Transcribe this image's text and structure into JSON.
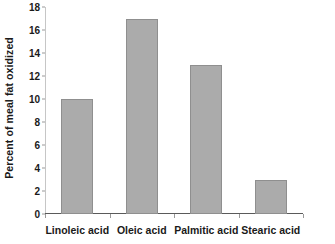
{
  "chart_data": {
    "type": "bar",
    "title": "",
    "xlabel": "",
    "ylabel": "Percent of meal fat oxidized",
    "categories": [
      "Linoleic acid",
      "Oleic acid",
      "Palmitic acid",
      "Stearic acid"
    ],
    "values": [
      10,
      17,
      13,
      3
    ],
    "series": [
      {
        "name": "Percent of meal fat oxidized",
        "values": [
          10,
          17,
          13,
          3
        ]
      }
    ],
    "ylim": [
      0,
      18
    ],
    "ytick_step": 2,
    "yticks": [
      0,
      2,
      4,
      6,
      8,
      10,
      12,
      14,
      16,
      18
    ],
    "ytick_labels": [
      "0",
      "2",
      "4",
      "6",
      "8",
      "10",
      "12",
      "14",
      "16",
      "18"
    ],
    "grid": false,
    "legend": false,
    "legend_position": "none",
    "bar_color": "#ababab",
    "bar_edge_color": "#8f8f8f",
    "axis_color": "#5a5a5a",
    "text_color": "#1a1a1a"
  }
}
